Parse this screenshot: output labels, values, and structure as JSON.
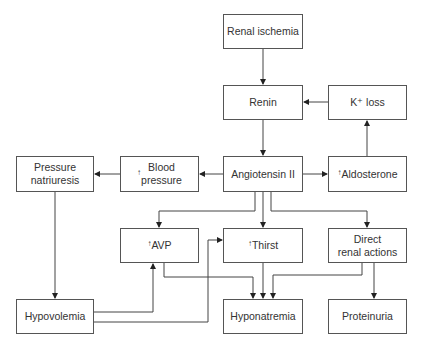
{
  "diagram": {
    "nodes": {
      "renal_ischemia": "Renal ischemia",
      "renin": "Renin",
      "k_loss": "K⁺ loss",
      "pressure_natriuresis": "Pressure\nnatriuresis",
      "blood_pressure": "Blood\npressure",
      "angiotensin": "Angiotensin II",
      "aldosterone": "Aldosterone",
      "avp": "AVP",
      "thirst": "Thirst",
      "direct_renal": "Direct\nrenal actions",
      "hypovolemia": "Hypovolemia",
      "hyponatremia": "Hyponatremia",
      "proteinuria": "Proteinuria"
    },
    "up_arrow": "↑",
    "edges": [
      [
        "Renal ischemia",
        "Renin"
      ],
      [
        "K+ loss",
        "Renin"
      ],
      [
        "Renin",
        "Angiotensin II"
      ],
      [
        "Angiotensin II",
        "Blood pressure"
      ],
      [
        "Blood pressure",
        "Pressure natriuresis"
      ],
      [
        "Angiotensin II",
        "Aldosterone"
      ],
      [
        "Aldosterone",
        "K+ loss"
      ],
      [
        "Angiotensin II",
        "AVP"
      ],
      [
        "Angiotensin II",
        "Thirst"
      ],
      [
        "Angiotensin II",
        "Direct renal actions"
      ],
      [
        "Pressure natriuresis",
        "Hypovolemia"
      ],
      [
        "Hypovolemia",
        "AVP"
      ],
      [
        "Hypovolemia",
        "Thirst"
      ],
      [
        "AVP",
        "Hyponatremia"
      ],
      [
        "Thirst",
        "Hyponatremia"
      ],
      [
        "Direct renal actions",
        "Hyponatremia"
      ],
      [
        "Direct renal actions",
        "Proteinuria"
      ]
    ]
  }
}
